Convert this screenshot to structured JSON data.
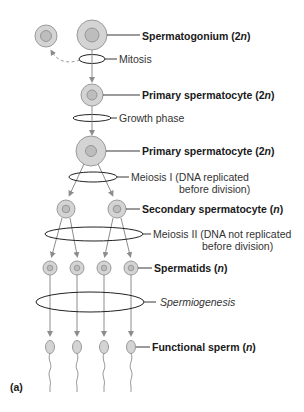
{
  "colors": {
    "cell_fill": "#d4d4d4",
    "cell_stroke": "#9a9a9a",
    "nucleus_fill": "#bdbdbd",
    "nucleus_stroke": "#8a8a8a",
    "arrow": "#8c8c8c",
    "ellipse": "#222222",
    "text": "#1a1a1a"
  },
  "stages": [
    {
      "id": "spermatogonium",
      "name": "Spermatogonium",
      "ploidy_num": "2",
      "ploidy_var": "n"
    },
    {
      "id": "primary1",
      "name": "Primary spermatocyte",
      "ploidy_num": "2",
      "ploidy_var": "n"
    },
    {
      "id": "primary2",
      "name": "Primary spermatocyte",
      "ploidy_num": "2",
      "ploidy_var": "n"
    },
    {
      "id": "secondary",
      "name": "Secondary spermatocyte",
      "ploidy_num": "",
      "ploidy_var": "n"
    },
    {
      "id": "spermatids",
      "name": "Spermatids",
      "ploidy_num": "",
      "ploidy_var": "n"
    },
    {
      "id": "sperm",
      "name": "Functional sperm",
      "ploidy_num": "",
      "ploidy_var": "n"
    }
  ],
  "processes": [
    {
      "id": "mitosis",
      "line1": "Mitosis",
      "line2": ""
    },
    {
      "id": "growth",
      "line1": "Growth phase",
      "line2": ""
    },
    {
      "id": "meiosis1",
      "line1": "Meiosis I (DNA replicated",
      "line2": "before division)"
    },
    {
      "id": "meiosis2",
      "line1": "Meiosis II (DNA not replicated",
      "line2": "before division)"
    },
    {
      "id": "spermiogenesis",
      "line1": "Spermiogenesis",
      "line2": ""
    }
  ],
  "panel_label": "(a)",
  "open_paren": "(",
  "close_paren": ")"
}
